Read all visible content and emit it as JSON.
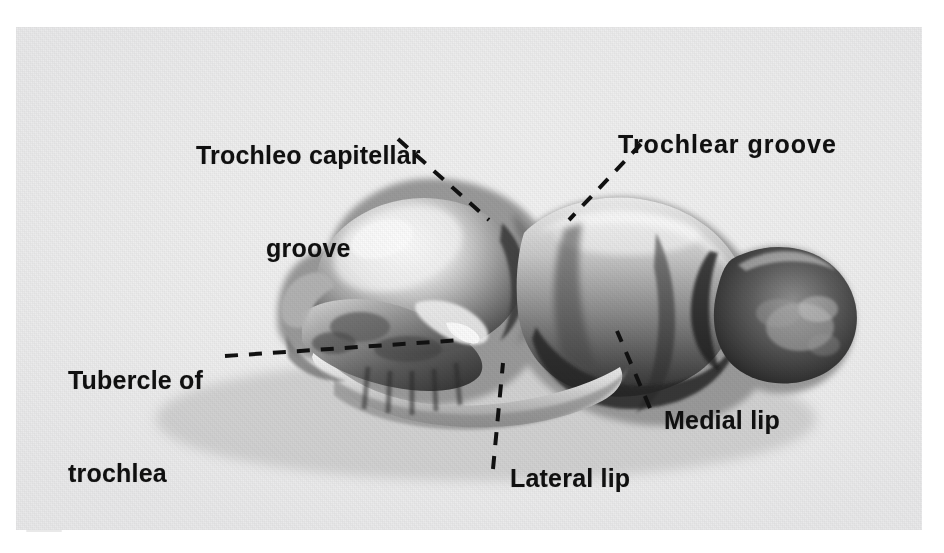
{
  "figure": {
    "kind": "anatomical-photograph",
    "background_color": "#ffffff",
    "plate_color": "#efefef"
  },
  "labels": [
    {
      "id": "trochleo-capitellar-groove",
      "line1": "Trochleo capitellar",
      "line2": "groove",
      "text": "Trochleo capitellar groove"
    },
    {
      "id": "trochlear-groove",
      "text": "Trochlear groove"
    },
    {
      "id": "tubercle-of-trochlea",
      "line1": "Tubercle of",
      "line2": "trochlea",
      "text": "Tubercle of trochlea"
    },
    {
      "id": "medial-lip",
      "text": "Medial lip"
    },
    {
      "id": "lateral-lip",
      "text": "Lateral lip"
    }
  ],
  "leader_lines": {
    "style": "dashed",
    "color": "#111111",
    "count": 5
  }
}
